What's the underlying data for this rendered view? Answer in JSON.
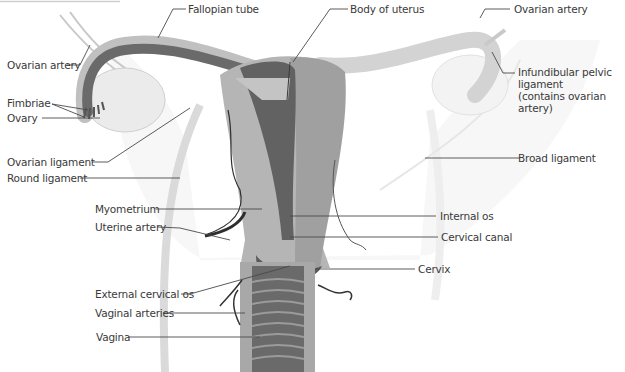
{
  "diagram": {
    "colors": {
      "dark": "#606060",
      "mid": "#9a9a9a",
      "light": "#b8b8b8",
      "pale": "#e2e2e2",
      "artery": "#2e2e2e",
      "leader": "#4a4a4a",
      "text": "#3a3a3a"
    },
    "labels": {
      "fallopian_tube": "Fallopian tube",
      "body_of_uterus": "Body of uterus",
      "ovarian_artery_left": "Ovarian artery",
      "ovarian_artery_right": "Ovarian artery",
      "infundibular_pelvic_ligament": "Infundibular pelvic\nligament\n(contains ovarian artery)",
      "fimbriae": "Fimbriae",
      "ovary": "Ovary",
      "ovarian_ligament": "Ovarian ligament",
      "round_ligament": "Round ligament",
      "broad_ligament": "Broad ligament",
      "myometrium": "Myometrium",
      "uterine_artery": "Uterine artery",
      "internal_os": "Internal os",
      "cervical_canal": "Cervical canal",
      "cervix": "Cervix",
      "external_cervical_os": "External cervical os",
      "vaginal_arteries": "Vaginal arteries",
      "vagina": "Vagina"
    }
  }
}
